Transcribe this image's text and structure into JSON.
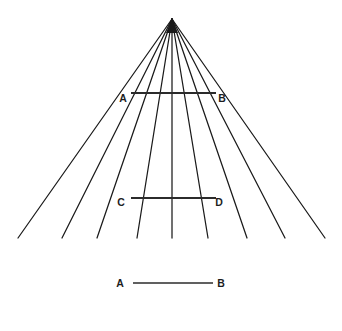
{
  "figure": {
    "background_color": "#ffffff",
    "line_color": "#1a1a1a",
    "label_color": "#1d1d1d",
    "width": 342,
    "height": 331,
    "vanishing_point": {
      "x": 172,
      "y": 19
    }
  },
  "rays": {
    "count": 9,
    "apex_x": 172,
    "apex_y": 19,
    "base_y": 238,
    "base_x_positions": [
      18,
      62,
      97,
      137,
      172,
      208,
      247,
      285,
      325
    ]
  },
  "transversals": [
    {
      "id": "AB",
      "y": 93,
      "x1": 131,
      "x2": 216,
      "left_label": "A",
      "right_label": "B",
      "left_label_x": 123,
      "right_label_x": 222,
      "label_y": 102
    },
    {
      "id": "CD",
      "y": 198,
      "x1": 131,
      "x2": 216,
      "left_label": "C",
      "right_label": "D",
      "left_label_x": 121,
      "right_label_x": 219,
      "label_y": 206
    }
  ],
  "reference_segment": {
    "id": "AB-reference",
    "y": 283,
    "x1": 133,
    "x2": 213,
    "left_label": "A",
    "right_label": "B",
    "left_label_x": 120,
    "right_label_x": 221,
    "label_y": 287
  },
  "labels": {
    "a_top": "A",
    "b_top": "B",
    "c_mid": "C",
    "d_mid": "D",
    "a_bottom": "A",
    "b_bottom": "B"
  }
}
